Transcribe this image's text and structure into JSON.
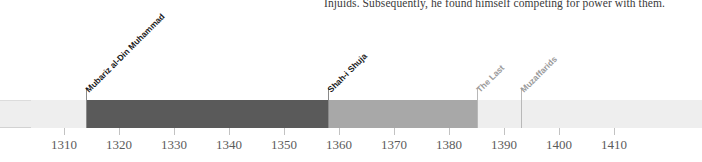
{
  "prose": {
    "line": "Injuids. Subsequently, he found himself competing for power with them."
  },
  "chart_data": {
    "type": "bar",
    "orientation": "horizontal-timeline",
    "title": "",
    "xlabel": "",
    "ylabel": "",
    "xlim": [
      1304,
      1426
    ],
    "grid": false,
    "legend": false,
    "tick_step": 10,
    "tick_labels": [
      "1310",
      "1320",
      "1330",
      "1340",
      "1350",
      "1360",
      "1370",
      "1380",
      "1390",
      "1400",
      "1410"
    ],
    "tick_values": [
      1310,
      1320,
      1330,
      1340,
      1350,
      1360,
      1370,
      1380,
      1390,
      1400,
      1410
    ],
    "segments": [
      {
        "name": "pre-reign",
        "start": 1304,
        "end": 1314,
        "color": "#eeeeee",
        "labelled": false
      },
      {
        "name": "Mubariz al-Din Muhammad",
        "start": 1314,
        "end": 1358,
        "color": "#5a5a5a",
        "labelled": true
      },
      {
        "name": "Shah-i Shuja",
        "start": 1358,
        "end": 1385,
        "color": "#a8a8a8",
        "labelled": true
      },
      {
        "name": "The Last",
        "start": 1385,
        "end": 1393,
        "color": "#eeeeee",
        "labelled": true
      },
      {
        "name": "Muzaffarids",
        "start": 1393,
        "end": 1426,
        "color": "#eeeeee",
        "labelled": true
      }
    ],
    "annotations": [
      {
        "text": "Mubariz al-Din Muhammad",
        "at": 1314,
        "style": "dark"
      },
      {
        "text": "Shah-i Shuja",
        "at": 1358,
        "style": "dark"
      },
      {
        "text": "The Last",
        "at": 1385,
        "style": "faint"
      },
      {
        "text": "Muzaffarids",
        "at": 1393,
        "style": "faint"
      }
    ],
    "colors": {
      "background": "#eeeeee",
      "dark_segment": "#5a5a5a",
      "mid_segment": "#a8a8a8",
      "axis_tick": "#c2c2c2",
      "axis_text": "#5b5b5b",
      "leader_line": "#8a8a8a"
    }
  }
}
